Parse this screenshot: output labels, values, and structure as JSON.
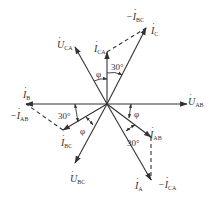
{
  "diagram": {
    "type": "phasor-diagram",
    "origin": [
      107,
      104
    ],
    "stroke_color": "#333333",
    "phasors": [
      {
        "id": "U_AB",
        "symbol": "U",
        "sub": "AB",
        "prefix": "",
        "end": [
          187,
          104
        ],
        "style": "solid"
      },
      {
        "id": "U_CA",
        "symbol": "U",
        "sub": "CA",
        "prefix": "",
        "end": [
          75,
          47
        ],
        "style": "solid"
      },
      {
        "id": "U_BC",
        "symbol": "U",
        "sub": "BC",
        "prefix": "",
        "end": [
          75,
          163
        ],
        "style": "solid"
      },
      {
        "id": "I_CA",
        "symbol": "I",
        "sub": "CA",
        "prefix": "",
        "end": [
          107,
          52
        ],
        "style": "solid"
      },
      {
        "id": "I_C",
        "symbol": "I",
        "sub": "C",
        "prefix": "",
        "end": [
          146,
          28
        ],
        "style": "solid"
      },
      {
        "id": "I_B",
        "symbol": "I",
        "sub": "B",
        "prefix": "",
        "end": [
          26,
          104
        ],
        "style": "solid"
      },
      {
        "id": "I_BC",
        "symbol": "I",
        "sub": "BC",
        "prefix": "",
        "end": [
          63,
          130
        ],
        "style": "solid"
      },
      {
        "id": "I_AB",
        "symbol": "I",
        "sub": "AB",
        "prefix": "",
        "end": [
          151,
          137
        ],
        "style": "solid"
      },
      {
        "id": "I_A",
        "symbol": "I",
        "sub": "A",
        "prefix": "",
        "end": [
          151,
          180
        ],
        "style": "solid"
      }
    ],
    "dashed_vectors": [
      {
        "id": "neg_I_BC",
        "symbol": "I",
        "sub": "BC",
        "prefix": "−",
        "from": [
          107,
          52
        ],
        "to": [
          146,
          28
        ]
      },
      {
        "id": "neg_I_AB",
        "symbol": "I",
        "sub": "AB",
        "prefix": "−",
        "from": [
          63,
          130
        ],
        "to": [
          26,
          104
        ]
      },
      {
        "id": "neg_I_CA",
        "symbol": "I",
        "sub": "CA",
        "prefix": "−",
        "from": [
          151,
          137
        ],
        "to": [
          151,
          180
        ]
      }
    ],
    "labels": {
      "U_AB": {
        "prefix": "",
        "symbol": "U",
        "sub": "AB"
      },
      "U_CA": {
        "prefix": "",
        "symbol": "U",
        "sub": "CA"
      },
      "U_BC": {
        "prefix": "",
        "symbol": "U",
        "sub": "BC"
      },
      "I_CA": {
        "prefix": "",
        "symbol": "I",
        "sub": "CA"
      },
      "I_C": {
        "prefix": "",
        "symbol": "I",
        "sub": "C"
      },
      "neg_I_BC": {
        "prefix": "−",
        "symbol": "I",
        "sub": "BC"
      },
      "I_B": {
        "prefix": "",
        "symbol": "I",
        "sub": "B"
      },
      "neg_I_AB": {
        "prefix": "−",
        "symbol": "I",
        "sub": "AB"
      },
      "I_BC": {
        "prefix": "",
        "symbol": "I",
        "sub": "BC"
      },
      "I_AB": {
        "prefix": "",
        "symbol": "I",
        "sub": "AB"
      },
      "I_A": {
        "prefix": "",
        "symbol": "I",
        "sub": "A"
      },
      "neg_I_CA": {
        "prefix": "−",
        "symbol": "I",
        "sub": "CA"
      }
    },
    "angles": {
      "phi_top": "φ",
      "thirty_top": "30°",
      "phi_right": "φ",
      "thirty_left": "30°",
      "phi_left": "φ",
      "thirty_bottom": "30°"
    }
  }
}
